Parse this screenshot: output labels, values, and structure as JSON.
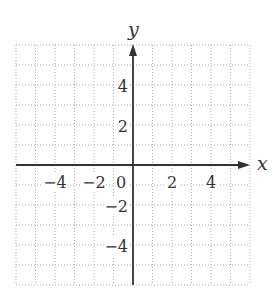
{
  "chart_data": {
    "type": "scatter",
    "title": "",
    "subtitle": "",
    "xlabel": "x",
    "ylabel": "y",
    "xlim": [
      -6,
      6
    ],
    "ylim": [
      -6,
      6
    ],
    "grid": true,
    "grid_style": "dotted",
    "grid_step": 1,
    "x_ticks": [
      -4,
      -2,
      0,
      2,
      4
    ],
    "x_tick_labels": [
      "−4",
      "−2",
      "0",
      "2",
      "4"
    ],
    "y_ticks": [
      4,
      2,
      -2,
      -4
    ],
    "y_tick_labels": [
      "4",
      "2",
      "−2",
      "−4"
    ],
    "series": [],
    "legend": null,
    "colors": {
      "axis": "#333333",
      "grid": "#b0b0b0",
      "background": "#ffffff"
    }
  }
}
